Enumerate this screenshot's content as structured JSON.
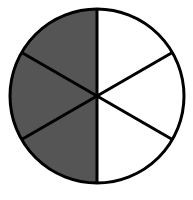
{
  "diagram": {
    "type": "fraction-circle",
    "total_parts": 6,
    "shaded_parts": 3,
    "shaded_side": "left",
    "colors": {
      "shaded": "#555555",
      "unshaded": "#ffffff",
      "stroke": "#000000"
    }
  }
}
